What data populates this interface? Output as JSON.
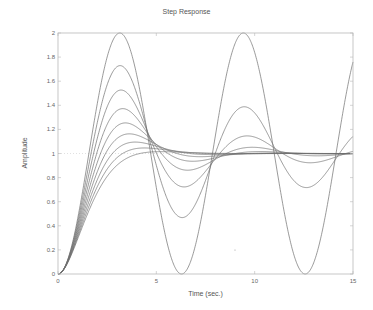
{
  "chart_data": {
    "type": "line",
    "title": "Step Response",
    "xlabel": "Time (sec.)",
    "ylabel": "Amplitude",
    "xlim": [
      0,
      15
    ],
    "ylim": [
      0,
      2
    ],
    "x_ticks": [
      0,
      5,
      10,
      15
    ],
    "y_ticks": [
      0,
      0.2,
      0.4,
      0.6,
      0.8,
      1,
      1.2,
      1.4,
      1.6,
      1.8,
      2
    ],
    "y_tick_labels": [
      "0",
      "0.2",
      "0.4",
      "0.6",
      "0.8",
      "1",
      "1.2",
      "1.4",
      "1.6",
      "1.8",
      "2"
    ],
    "grid": false,
    "legend": null,
    "reference_line": {
      "y": 1,
      "style": "dotted"
    },
    "system": "second-order, wn = 1 rad/s",
    "series": [
      {
        "name": "zeta=0.0",
        "zeta": 0.0,
        "peak": 2.0,
        "x": [
          0,
          1,
          2,
          3,
          4,
          5,
          6,
          7,
          8,
          9,
          10,
          11,
          12,
          13,
          14,
          15
        ],
        "values": [
          0,
          0.46,
          1.42,
          1.99,
          1.65,
          0.72,
          0.04,
          0.25,
          1.15,
          1.91,
          1.84,
          0.99,
          0.16,
          0.09,
          0.86,
          1.76
        ]
      },
      {
        "name": "zeta=0.1",
        "zeta": 0.1,
        "peak": 1.73
      },
      {
        "name": "zeta=0.2",
        "zeta": 0.2,
        "peak": 1.53
      },
      {
        "name": "zeta=0.3",
        "zeta": 0.3,
        "peak": 1.37
      },
      {
        "name": "zeta=0.4",
        "zeta": 0.4,
        "peak": 1.25
      },
      {
        "name": "zeta=0.5",
        "zeta": 0.5,
        "peak": 1.16
      },
      {
        "name": "zeta=0.6",
        "zeta": 0.6,
        "peak": 1.09
      },
      {
        "name": "zeta=0.7",
        "zeta": 0.7,
        "peak": 1.05
      },
      {
        "name": "zeta=0.8",
        "zeta": 0.8,
        "peak": 1.02
      }
    ],
    "colors": {
      "line": "#6e6e6e",
      "axis": "#b8b8b8",
      "reference": "#cccccc"
    }
  }
}
